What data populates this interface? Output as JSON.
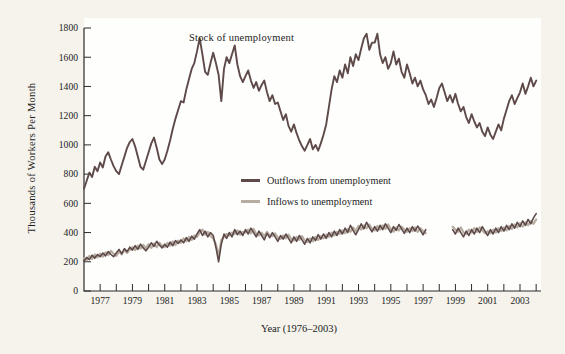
{
  "figure": {
    "background": "#f5f3ec",
    "plot_background": "#fefefd",
    "axis_color": "#2b2b2b",
    "annotation": "Stock of unemployment",
    "ylabel": "Thousands of Workers Per Month",
    "xlabel": "Year (1976–2003)",
    "legend": [
      {
        "label": "Outflows from unemployment",
        "color": "#5d4a49"
      },
      {
        "label": "Inflows to unemployment",
        "color": "#b8ada1"
      }
    ]
  },
  "chart_data": {
    "type": "line",
    "title": "",
    "annotation": "Stock of unemployment",
    "xlabel": "Year (1976–2003)",
    "ylabel": "Thousands of Workers Per Month",
    "xlim": [
      1976,
      2004.3
    ],
    "ylim": [
      0,
      1800
    ],
    "grid": false,
    "legend_position": "inside center-left, stacked",
    "y_ticks": [
      0,
      200,
      400,
      600,
      800,
      1000,
      1200,
      1400,
      1600,
      1800
    ],
    "x_tick_years": [
      1977,
      1978,
      1979,
      1980,
      1981,
      1982,
      1983,
      1984,
      1985,
      1986,
      1987,
      1988,
      1989,
      1990,
      1991,
      1992,
      1993,
      1994,
      1995,
      1996,
      1997,
      1998,
      1999,
      2000,
      2001,
      2002,
      2003,
      2004
    ],
    "x_label_years": [
      1977,
      1979,
      1981,
      1983,
      1985,
      1987,
      1989,
      1991,
      1993,
      1995,
      1997,
      1999,
      2001,
      2003
    ],
    "x_start_year": 1976,
    "x_step_months": 2,
    "units": "thousands of workers per month",
    "data_gap": "inflow/outflow series have no data from mid-1997 to late 1998",
    "series": [
      {
        "name": "Stock of unemployment",
        "color": "#5d4a49",
        "width": 1.9,
        "values": [
          700,
          755,
          810,
          780,
          850,
          820,
          880,
          845,
          920,
          950,
          900,
          855,
          820,
          800,
          860,
          920,
          980,
          1020,
          1040,
          990,
          920,
          850,
          830,
          890,
          950,
          1010,
          1050,
          980,
          900,
          870,
          900,
          960,
          1030,
          1110,
          1180,
          1240,
          1300,
          1290,
          1380,
          1450,
          1520,
          1560,
          1640,
          1730,
          1620,
          1500,
          1480,
          1560,
          1630,
          1560,
          1480,
          1300,
          1520,
          1600,
          1560,
          1620,
          1680,
          1550,
          1470,
          1430,
          1470,
          1510,
          1440,
          1390,
          1430,
          1370,
          1410,
          1440,
          1360,
          1300,
          1340,
          1280,
          1290,
          1230,
          1170,
          1210,
          1130,
          1090,
          1140,
          1080,
          1030,
          990,
          960,
          1000,
          1040,
          970,
          1000,
          960,
          1010,
          1070,
          1140,
          1260,
          1380,
          1470,
          1430,
          1510,
          1460,
          1550,
          1490,
          1600,
          1540,
          1620,
          1580,
          1660,
          1730,
          1760,
          1650,
          1700,
          1700,
          1760,
          1620,
          1560,
          1600,
          1520,
          1560,
          1640,
          1550,
          1590,
          1500,
          1460,
          1550,
          1490,
          1420,
          1460,
          1400,
          1440,
          1380,
          1340,
          1280,
          1310,
          1260,
          1320,
          1390,
          1420,
          1360,
          1300,
          1340,
          1290,
          1350,
          1280,
          1230,
          1260,
          1190,
          1150,
          1210,
          1160,
          1120,
          1150,
          1090,
          1060,
          1120,
          1070,
          1040,
          1090,
          1140,
          1100,
          1180,
          1240,
          1300,
          1340,
          1280,
          1320,
          1360,
          1420,
          1350,
          1400,
          1460,
          1400,
          1440
        ]
      },
      {
        "name": "Outflows from unemployment",
        "color": "#5d4a49",
        "width": 1.6,
        "values": [
          205,
          230,
          215,
          245,
          225,
          250,
          235,
          260,
          240,
          270,
          250,
          235,
          260,
          285,
          255,
          290,
          270,
          300,
          280,
          310,
          285,
          320,
          295,
          275,
          300,
          330,
          305,
          340,
          315,
          295,
          320,
          300,
          335,
          310,
          345,
          325,
          350,
          330,
          365,
          340,
          375,
          355,
          390,
          420,
          380,
          410,
          370,
          400,
          380,
          300,
          200,
          320,
          390,
          360,
          400,
          370,
          420,
          385,
          410,
          380,
          420,
          390,
          430,
          400,
          370,
          410,
          380,
          350,
          395,
          365,
          400,
          370,
          340,
          380,
          355,
          390,
          360,
          330,
          370,
          340,
          380,
          350,
          320,
          360,
          330,
          370,
          345,
          385,
          355,
          390,
          360,
          400,
          370,
          410,
          380,
          420,
          390,
          430,
          400,
          450,
          415,
          385,
          420,
          460,
          425,
          470,
          435,
          405,
          440,
          410,
          450,
          420,
          460,
          430,
          400,
          440,
          415,
          455,
          425,
          395,
          430,
          400,
          440,
          410,
          445,
          415,
          385,
          420,
          null,
          null,
          null,
          null,
          null,
          null,
          null,
          null,
          null,
          420,
          390,
          430,
          400,
          370,
          410,
          380,
          420,
          390,
          430,
          400,
          440,
          410,
          380,
          420,
          390,
          430,
          400,
          440,
          410,
          450,
          420,
          460,
          430,
          470,
          440,
          480,
          450,
          490,
          460,
          500,
          530
        ]
      },
      {
        "name": "Inflows to unemployment",
        "color": "#b8ada1",
        "width": 2.2,
        "values": [
          225,
          210,
          240,
          220,
          250,
          230,
          255,
          235,
          265,
          245,
          275,
          255,
          240,
          270,
          250,
          280,
          260,
          285,
          300,
          280,
          310,
          290,
          315,
          295,
          320,
          295,
          325,
          300,
          330,
          310,
          300,
          330,
          310,
          340,
          315,
          345,
          330,
          360,
          340,
          370,
          350,
          380,
          370,
          400,
          420,
          385,
          405,
          375,
          360,
          320,
          240,
          350,
          370,
          390,
          380,
          400,
          390,
          415,
          385,
          405,
          400,
          420,
          395,
          425,
          390,
          380,
          400,
          375,
          405,
          380,
          375,
          395,
          365,
          355,
          380,
          360,
          385,
          355,
          345,
          370,
          350,
          375,
          345,
          335,
          360,
          340,
          370,
          350,
          375,
          360,
          385,
          370,
          400,
          380,
          405,
          390,
          415,
          395,
          425,
          405,
          435,
          410,
          445,
          420,
          450,
          430,
          455,
          425,
          415,
          445,
          420,
          450,
          425,
          455,
          425,
          405,
          435,
          415,
          440,
          420,
          405,
          430,
          410,
          435,
          405,
          430,
          410,
          395,
          null,
          null,
          null,
          null,
          null,
          null,
          null,
          null,
          null,
          440,
          420,
          405,
          435,
          400,
          390,
          420,
          400,
          430,
          405,
          435,
          415,
          395,
          410,
          395,
          420,
          400,
          430,
          410,
          435,
          415,
          445,
          425,
          455,
          435,
          465,
          440,
          470,
          450,
          480,
          460,
          490
        ]
      }
    ]
  }
}
